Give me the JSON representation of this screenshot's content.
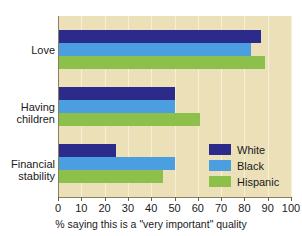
{
  "chart_data": {
    "type": "bar",
    "orientation": "horizontal",
    "title": "",
    "xlabel": "% saying this is a \"very important\" quality",
    "ylabel": "",
    "xlim": [
      0,
      100
    ],
    "xticks": [
      0,
      10,
      20,
      30,
      40,
      50,
      60,
      70,
      80,
      90,
      100
    ],
    "grid": true,
    "legend_position": "inside-right-lower",
    "categories": [
      "Love",
      "Having children",
      "Financial stability"
    ],
    "series": [
      {
        "name": "White",
        "color": "#2c2b8b",
        "values": [
          87,
          50,
          25
        ]
      },
      {
        "name": "Black",
        "color": "#4b9fe1",
        "values": [
          83,
          50,
          50
        ]
      },
      {
        "name": "Hispanic",
        "color": "#8dbf4b",
        "values": [
          89,
          61,
          45
        ]
      }
    ]
  },
  "axis": {
    "x_tick_labels": [
      "0",
      "10",
      "20",
      "30",
      "40",
      "50",
      "60",
      "70",
      "80",
      "90",
      "100"
    ],
    "x_title": "% saying this is a \"very important\" quality"
  },
  "categories": {
    "love": "Love",
    "having_children": "Having\nchildren",
    "financial_stability": "Financial\nstability"
  },
  "legend": {
    "items": [
      {
        "label": "White"
      },
      {
        "label": "Black"
      },
      {
        "label": "Hispanic"
      }
    ]
  },
  "colors": {
    "white_series": "#2c2b8b",
    "black_series": "#4b9fe1",
    "hispanic_series": "#8dbf4b",
    "plot_background": "#ece0b9",
    "page_background": "#ffffff"
  }
}
